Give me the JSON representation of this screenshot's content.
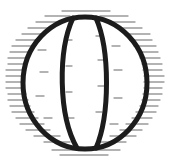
{
  "icon": {
    "name": "globe-icon",
    "stroke_color": "#1c1c1c",
    "hatch_color": "#9a9a9a",
    "background": "#ffffff"
  }
}
